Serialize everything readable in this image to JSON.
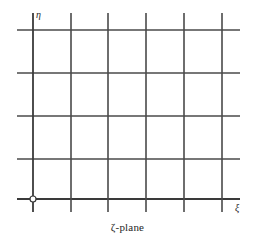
{
  "figure": {
    "caption": "ζ-plane",
    "axis_labels": {
      "vertical": "η",
      "horizontal": "ξ"
    },
    "origin_marker": "open-circle"
  },
  "chart_data": {
    "type": "line",
    "title": "ζ-plane",
    "subtitle": "",
    "xlabel": "ξ",
    "ylabel": "η",
    "grid": true,
    "legend": false,
    "legend_position": "none",
    "xlim": [
      0,
      6
    ],
    "ylim": [
      0,
      5
    ],
    "xticks": [
      0,
      1,
      2,
      3,
      4,
      5
    ],
    "yticks": [
      0,
      1,
      2,
      3,
      4
    ],
    "xtick_labels": [
      "",
      "",
      "",
      "",
      "",
      ""
    ],
    "ytick_labels": [
      "",
      "",
      "",
      "",
      ""
    ],
    "series": [
      {
        "name": "constant-ξ lines",
        "orientation": "vertical",
        "count": 6,
        "values": [
          0,
          1,
          2,
          3,
          4,
          5
        ],
        "pixel_x": [
          33,
          71,
          108,
          146,
          184,
          222
        ],
        "pixel_y_start": 13,
        "pixel_y_end": 212,
        "color": "#4a4a4a",
        "width": 1.6
      },
      {
        "name": "constant-η lines",
        "orientation": "horizontal",
        "count": 5,
        "values": [
          4,
          3,
          2,
          1,
          0
        ],
        "pixel_y": [
          30,
          73,
          116,
          159,
          199
        ],
        "pixel_x_start": 17,
        "pixel_x_end": 240,
        "color": "#4a4a4a",
        "width": 1.6
      }
    ],
    "annotations": [
      {
        "name": "origin-marker",
        "kind": "open-circle",
        "x": 0,
        "y": 0,
        "pixel_x": 33,
        "pixel_y": 199,
        "radius": 3
      },
      {
        "name": "eta-axis-label",
        "text": "η",
        "pixel_x": 36,
        "pixel_y": 10
      },
      {
        "name": "xi-axis-label",
        "text": "ξ",
        "pixel_x": 235,
        "pixel_y": 203
      }
    ],
    "colors": {
      "line": "#4a4a4a",
      "axis": "#3a3a3a",
      "text": "#1f1f1f",
      "background": "#ffffff"
    }
  }
}
